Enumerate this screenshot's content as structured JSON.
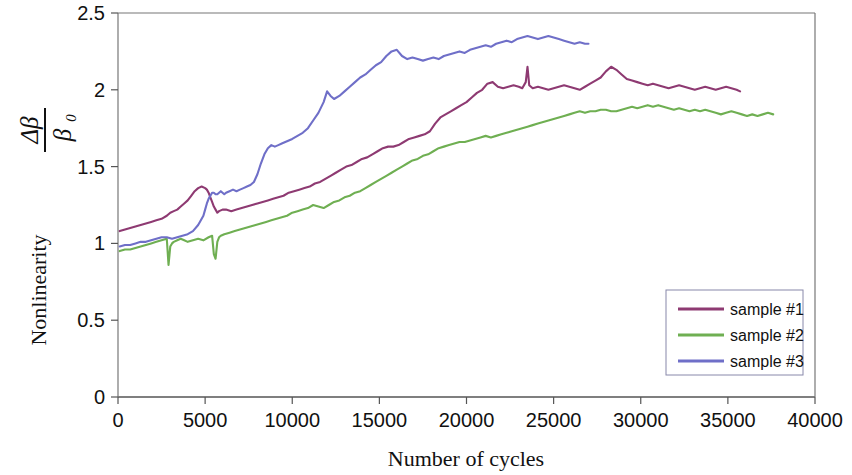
{
  "chart_data": {
    "type": "line",
    "title": "",
    "xlabel": "Number of cycles",
    "ylabel": "Nonlinearity",
    "ylabel_symbol_numerator": "Δβ",
    "ylabel_symbol_denominator": "β",
    "ylabel_symbol_subscript": "0",
    "xlim": [
      0,
      40000
    ],
    "ylim": [
      0,
      2.5
    ],
    "xticks": [
      0,
      5000,
      10000,
      15000,
      20000,
      25000,
      30000,
      35000,
      40000
    ],
    "xtick_labels": [
      "0",
      "5000",
      "10000",
      "15000",
      "20000",
      "25000",
      "30000",
      "35000",
      "40000"
    ],
    "yticks": [
      0,
      0.5,
      1,
      1.5,
      2,
      2.5
    ],
    "ytick_labels": [
      "0",
      "0.5",
      "1",
      "1.5",
      "2",
      "2.5"
    ],
    "grid": false,
    "legend_position": "bottom-right",
    "frame": true,
    "series": [
      {
        "name": "sample #1",
        "color": "#8E3A72",
        "x": [
          100,
          400,
          700,
          1000,
          1300,
          1600,
          1900,
          2200,
          2500,
          2800,
          3000,
          3200,
          3400,
          3600,
          3800,
          4000,
          4200,
          4400,
          4600,
          4800,
          5000,
          5100,
          5200,
          5300,
          5400,
          5500,
          5600,
          5700,
          5800,
          6000,
          6200,
          6500,
          6800,
          7100,
          7400,
          7700,
          8000,
          8300,
          8600,
          8900,
          9200,
          9500,
          9800,
          10100,
          10400,
          10700,
          11000,
          11300,
          11600,
          11900,
          12200,
          12500,
          12800,
          13100,
          13400,
          13700,
          14000,
          14300,
          14600,
          14900,
          15200,
          15500,
          15800,
          16100,
          16400,
          16700,
          17000,
          17300,
          17600,
          17900,
          18200,
          18500,
          18800,
          19100,
          19400,
          19700,
          20000,
          20300,
          20600,
          20900,
          21200,
          21500,
          21800,
          22100,
          22400,
          22700,
          23000,
          23200,
          23400,
          23500,
          23600,
          23800,
          24100,
          24400,
          24700,
          25000,
          25300,
          25600,
          25900,
          26200,
          26500,
          26800,
          27100,
          27400,
          27700,
          28000,
          28300,
          28600,
          28900,
          29200,
          29500,
          29800,
          30100,
          30400,
          30700,
          31000,
          31300,
          31600,
          31900,
          32200,
          32500,
          32800,
          33100,
          33400,
          33700,
          34000,
          34300,
          34600,
          34900,
          35200,
          35500,
          35700
        ],
        "y": [
          1.08,
          1.09,
          1.1,
          1.11,
          1.12,
          1.13,
          1.14,
          1.15,
          1.16,
          1.18,
          1.2,
          1.21,
          1.22,
          1.24,
          1.26,
          1.28,
          1.31,
          1.34,
          1.36,
          1.37,
          1.36,
          1.35,
          1.33,
          1.3,
          1.27,
          1.24,
          1.22,
          1.2,
          1.21,
          1.22,
          1.22,
          1.21,
          1.22,
          1.23,
          1.24,
          1.25,
          1.26,
          1.27,
          1.28,
          1.29,
          1.3,
          1.31,
          1.33,
          1.34,
          1.35,
          1.36,
          1.37,
          1.39,
          1.4,
          1.42,
          1.44,
          1.46,
          1.48,
          1.5,
          1.51,
          1.53,
          1.55,
          1.56,
          1.58,
          1.6,
          1.62,
          1.63,
          1.63,
          1.64,
          1.66,
          1.68,
          1.69,
          1.7,
          1.71,
          1.73,
          1.78,
          1.82,
          1.84,
          1.86,
          1.88,
          1.9,
          1.92,
          1.95,
          1.98,
          2.0,
          2.04,
          2.05,
          2.02,
          2.01,
          2.02,
          2.03,
          2.02,
          2.01,
          2.05,
          2.15,
          2.03,
          2.01,
          2.02,
          2.01,
          2.0,
          2.01,
          2.02,
          2.03,
          2.02,
          2.01,
          2.0,
          2.02,
          2.04,
          2.06,
          2.08,
          2.12,
          2.15,
          2.13,
          2.1,
          2.07,
          2.06,
          2.05,
          2.04,
          2.03,
          2.04,
          2.03,
          2.02,
          2.01,
          2.02,
          2.03,
          2.02,
          2.01,
          2.0,
          2.01,
          2.02,
          2.01,
          2.0,
          2.01,
          2.02,
          2.01,
          2.0,
          1.99
        ]
      },
      {
        "name": "sample #2",
        "color": "#6FAF52",
        "x": [
          100,
          400,
          700,
          1000,
          1300,
          1600,
          1900,
          2200,
          2500,
          2800,
          2900,
          3000,
          3100,
          3200,
          3400,
          3600,
          3800,
          4000,
          4300,
          4600,
          4900,
          5200,
          5400,
          5500,
          5600,
          5700,
          5800,
          5900,
          6100,
          6400,
          6700,
          7000,
          7300,
          7600,
          7900,
          8200,
          8500,
          8800,
          9100,
          9400,
          9700,
          10000,
          10300,
          10600,
          10900,
          11200,
          11500,
          11800,
          12100,
          12400,
          12700,
          13000,
          13300,
          13600,
          13900,
          14200,
          14500,
          14800,
          15100,
          15400,
          15700,
          16000,
          16300,
          16600,
          16900,
          17200,
          17500,
          17800,
          18100,
          18400,
          18700,
          19000,
          19300,
          19600,
          19900,
          20200,
          20500,
          20800,
          21100,
          21400,
          21700,
          22000,
          22300,
          22600,
          22900,
          23200,
          23500,
          23800,
          24100,
          24400,
          24700,
          25000,
          25300,
          25600,
          25900,
          26200,
          26500,
          26800,
          27100,
          27400,
          27700,
          28000,
          28300,
          28600,
          28900,
          29200,
          29500,
          29800,
          30100,
          30400,
          30700,
          31000,
          31300,
          31600,
          31900,
          32200,
          32500,
          32800,
          33100,
          33400,
          33700,
          34000,
          34300,
          34600,
          34900,
          35200,
          35500,
          35800,
          36100,
          36400,
          36700,
          37000,
          37300,
          37600
        ],
        "y": [
          0.95,
          0.96,
          0.96,
          0.97,
          0.98,
          0.99,
          1.0,
          1.01,
          1.02,
          1.03,
          0.86,
          0.98,
          1.0,
          1.01,
          1.02,
          1.03,
          1.02,
          1.01,
          1.02,
          1.03,
          1.02,
          1.04,
          1.05,
          0.93,
          0.9,
          1.01,
          1.04,
          1.05,
          1.06,
          1.07,
          1.08,
          1.09,
          1.1,
          1.11,
          1.12,
          1.13,
          1.14,
          1.15,
          1.16,
          1.17,
          1.18,
          1.2,
          1.21,
          1.22,
          1.23,
          1.25,
          1.24,
          1.23,
          1.25,
          1.27,
          1.28,
          1.3,
          1.31,
          1.33,
          1.34,
          1.36,
          1.38,
          1.4,
          1.42,
          1.44,
          1.46,
          1.48,
          1.5,
          1.52,
          1.54,
          1.55,
          1.57,
          1.58,
          1.6,
          1.62,
          1.63,
          1.64,
          1.65,
          1.66,
          1.66,
          1.67,
          1.68,
          1.69,
          1.7,
          1.69,
          1.7,
          1.71,
          1.72,
          1.73,
          1.74,
          1.75,
          1.76,
          1.77,
          1.78,
          1.79,
          1.8,
          1.81,
          1.82,
          1.83,
          1.84,
          1.85,
          1.86,
          1.85,
          1.86,
          1.86,
          1.87,
          1.87,
          1.86,
          1.86,
          1.87,
          1.88,
          1.89,
          1.88,
          1.89,
          1.9,
          1.89,
          1.9,
          1.89,
          1.88,
          1.87,
          1.88,
          1.87,
          1.86,
          1.87,
          1.86,
          1.87,
          1.86,
          1.85,
          1.84,
          1.85,
          1.86,
          1.85,
          1.84,
          1.83,
          1.84,
          1.83,
          1.84,
          1.85,
          1.84
        ]
      },
      {
        "name": "sample #3",
        "color": "#6F6FC8",
        "x": [
          100,
          400,
          700,
          1000,
          1300,
          1600,
          1900,
          2200,
          2500,
          2800,
          3100,
          3400,
          3700,
          4000,
          4300,
          4600,
          4900,
          5000,
          5100,
          5200,
          5300,
          5400,
          5500,
          5600,
          5700,
          5800,
          5900,
          6000,
          6100,
          6200,
          6400,
          6600,
          6800,
          7000,
          7200,
          7400,
          7600,
          7800,
          8000,
          8200,
          8400,
          8600,
          8800,
          9000,
          9200,
          9400,
          9600,
          9800,
          10000,
          10300,
          10600,
          10900,
          11200,
          11500,
          11800,
          12000,
          12200,
          12400,
          12700,
          13000,
          13300,
          13600,
          13900,
          14200,
          14500,
          14800,
          15100,
          15400,
          15700,
          16000,
          16300,
          16600,
          16900,
          17200,
          17500,
          17800,
          18100,
          18400,
          18700,
          19000,
          19300,
          19600,
          19900,
          20200,
          20500,
          20800,
          21100,
          21400,
          21700,
          22000,
          22300,
          22600,
          22900,
          23200,
          23500,
          23800,
          24100,
          24400,
          24700,
          25000,
          25300,
          25600,
          25900,
          26200,
          26500,
          26800,
          27000
        ],
        "y": [
          0.98,
          0.99,
          0.99,
          1.0,
          1.01,
          1.01,
          1.02,
          1.03,
          1.04,
          1.04,
          1.03,
          1.04,
          1.05,
          1.06,
          1.08,
          1.12,
          1.18,
          1.22,
          1.26,
          1.29,
          1.31,
          1.33,
          1.33,
          1.32,
          1.32,
          1.33,
          1.34,
          1.33,
          1.32,
          1.33,
          1.34,
          1.35,
          1.34,
          1.35,
          1.36,
          1.37,
          1.38,
          1.4,
          1.45,
          1.52,
          1.58,
          1.62,
          1.64,
          1.63,
          1.64,
          1.65,
          1.66,
          1.67,
          1.68,
          1.7,
          1.72,
          1.75,
          1.8,
          1.85,
          1.92,
          1.99,
          1.96,
          1.94,
          1.96,
          1.99,
          2.02,
          2.05,
          2.08,
          2.1,
          2.13,
          2.16,
          2.18,
          2.22,
          2.25,
          2.26,
          2.22,
          2.2,
          2.21,
          2.2,
          2.19,
          2.2,
          2.21,
          2.2,
          2.22,
          2.23,
          2.24,
          2.25,
          2.24,
          2.26,
          2.27,
          2.28,
          2.29,
          2.28,
          2.3,
          2.31,
          2.32,
          2.31,
          2.33,
          2.34,
          2.35,
          2.34,
          2.33,
          2.34,
          2.35,
          2.34,
          2.33,
          2.32,
          2.31,
          2.3,
          2.31,
          2.3,
          2.3
        ]
      }
    ]
  },
  "legend": {
    "items": [
      {
        "label": "sample #1",
        "color": "#8E3A72"
      },
      {
        "label": "sample #2",
        "color": "#6FAF52"
      },
      {
        "label": "sample #3",
        "color": "#6F6FC8"
      }
    ]
  },
  "axes": {
    "x_title": "Number of cycles",
    "y_title": "Nonlinearity",
    "y_numerator": "Δβ",
    "y_denominator": "β",
    "y_denominator_sub": "0"
  }
}
